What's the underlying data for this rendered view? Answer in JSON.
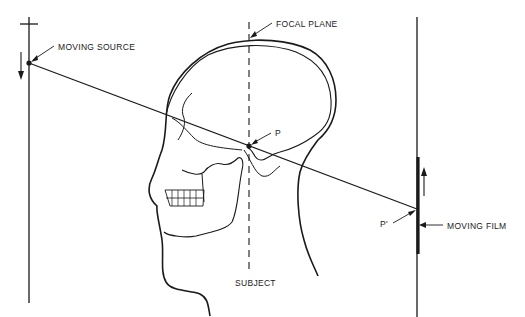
{
  "diagram": {
    "type": "tomography-principle",
    "labels": {
      "source": "MOVING SOURCE",
      "focal_plane": "FOCAL PLANE",
      "point": "P",
      "point_image": "P'",
      "film": "MOVING FILM",
      "subject": "SUBJECT"
    },
    "colors": {
      "ink": "#1a1a1a",
      "background": "#ffffff"
    }
  }
}
